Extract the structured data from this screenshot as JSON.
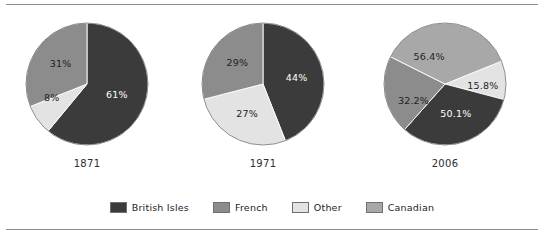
{
  "figure": {
    "background_color": "#ffffff",
    "rule_color": "#8d8d8d"
  },
  "chart_data": {
    "type": "pie",
    "title": "",
    "subtitle": "",
    "xlabel": "",
    "ylabel": "",
    "legend_position": "bottom",
    "note": "Three pie charts of ethnic origin shares for 1871, 1971 and 2006. The 2006 chart reports multiple-origin responses so its values sum to more than 100%.",
    "categories": [
      "British Isles",
      "French",
      "Other",
      "Canadian"
    ],
    "colors": {
      "British Isles": "#3b3b3b",
      "French": "#8c8c8c",
      "Other": "#e3e3e3",
      "Canadian": "#a8a8a8"
    },
    "label_colors": {
      "British Isles": "#ffffff",
      "French": "#1e1e1e",
      "Other": "#1e1e1e",
      "Canadian": "#1e1e1e"
    },
    "charts": [
      {
        "name": "1871",
        "caption": "1871",
        "start_angle_deg": 0,
        "direction": "clockwise",
        "slices": [
          {
            "category": "British Isles",
            "value": 61,
            "label": "61%",
            "label_r": 0.52,
            "label_angle_deg": 110
          },
          {
            "category": "Other",
            "value": 8,
            "label": "8%",
            "label_r": 0.62,
            "label_angle_deg": 249
          },
          {
            "category": "French",
            "value": 31,
            "label": "31%",
            "label_r": 0.55,
            "label_angle_deg": 308
          }
        ]
      },
      {
        "name": "1971",
        "caption": "1971",
        "start_angle_deg": 0,
        "direction": "clockwise",
        "slices": [
          {
            "category": "British Isles",
            "value": 44,
            "label": "44%",
            "label_r": 0.56,
            "label_angle_deg": 79
          },
          {
            "category": "Other",
            "value": 27,
            "label": "27%",
            "label_r": 0.55,
            "label_angle_deg": 208
          },
          {
            "category": "French",
            "value": 29,
            "label": "29%",
            "label_r": 0.55,
            "label_angle_deg": 310
          }
        ]
      },
      {
        "name": "2006",
        "caption": "2006",
        "start_angle_deg": 68,
        "direction": "clockwise",
        "slices": [
          {
            "category": "Other",
            "value": 15.8,
            "label": "15.8%",
            "label_r": 0.62,
            "label_angle_deg": 92
          },
          {
            "category": "British Isles",
            "value": 50.1,
            "label": "50.1%",
            "label_r": 0.52,
            "label_angle_deg": 160
          },
          {
            "category": "French",
            "value": 32.2,
            "label": "32.2%",
            "label_r": 0.58,
            "label_angle_deg": 243
          },
          {
            "category": "Canadian",
            "value": 56.4,
            "label": "56.4%",
            "label_r": 0.52,
            "label_angle_deg": 330
          }
        ]
      }
    ],
    "legend": [
      {
        "label": "British Isles",
        "color": "#3b3b3b"
      },
      {
        "label": "French",
        "color": "#8c8c8c"
      },
      {
        "label": "Other",
        "color": "#e3e3e3"
      },
      {
        "label": "Canadian",
        "color": "#a8a8a8"
      }
    ]
  }
}
